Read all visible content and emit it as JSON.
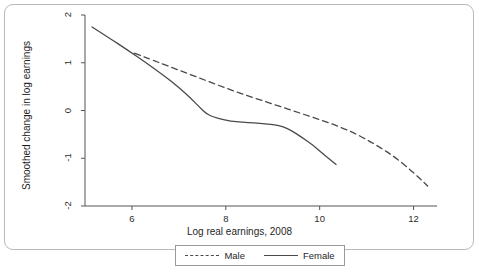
{
  "figure": {
    "frame_border_color": "#b9b9b9",
    "background": "#ffffff"
  },
  "chart_data": {
    "type": "line",
    "title": "",
    "xlabel": "Log real earnings, 2008",
    "ylabel": "Smoothed change in log earnings",
    "xlim": [
      5.0,
      12.5
    ],
    "ylim": [
      -2.0,
      2.0
    ],
    "xticks": [
      6,
      8,
      10,
      12
    ],
    "xtick_labels": [
      "6",
      "8",
      "10",
      "12"
    ],
    "yticks": [
      2,
      1,
      0,
      -1,
      -2
    ],
    "ytick_labels": [
      "2",
      "1",
      "0",
      "-1",
      "-2"
    ],
    "grid": false,
    "legend_position": "bottom-center",
    "series": [
      {
        "name": "Male",
        "style": "dashed",
        "color": "#4a4a4a",
        "x": [
          6.05,
          6.4,
          6.8,
          7.2,
          7.6,
          8.0,
          8.4,
          8.8,
          9.2,
          9.6,
          10.0,
          10.4,
          10.8,
          11.2,
          11.6,
          12.0,
          12.3
        ],
        "y": [
          1.2,
          1.07,
          0.92,
          0.77,
          0.62,
          0.47,
          0.33,
          0.2,
          0.07,
          -0.06,
          -0.19,
          -0.33,
          -0.5,
          -0.72,
          -0.97,
          -1.3,
          -1.58
        ]
      },
      {
        "name": "Female",
        "style": "solid",
        "color": "#4a4a4a",
        "x": [
          5.15,
          5.5,
          5.9,
          6.3,
          6.7,
          7.0,
          7.25,
          7.45,
          7.6,
          7.75,
          7.9,
          8.1,
          8.35,
          8.6,
          8.85,
          9.05,
          9.2,
          9.4,
          9.6,
          9.85,
          10.1,
          10.35
        ],
        "y": [
          1.75,
          1.53,
          1.27,
          1.0,
          0.72,
          0.48,
          0.26,
          0.06,
          -0.08,
          -0.14,
          -0.18,
          -0.22,
          -0.25,
          -0.26,
          -0.28,
          -0.3,
          -0.33,
          -0.42,
          -0.55,
          -0.72,
          -0.93,
          -1.13
        ]
      }
    ]
  },
  "legend": {
    "entries": [
      {
        "label": "Male",
        "style": "dashed"
      },
      {
        "label": "Female",
        "style": "solid"
      }
    ]
  }
}
